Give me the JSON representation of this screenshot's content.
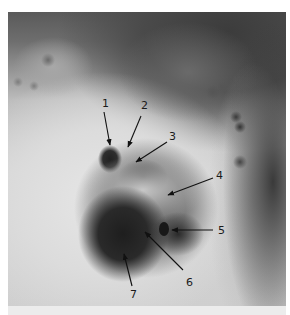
{
  "figure": {
    "type": "photograph",
    "colors": {
      "background": "#ffffff",
      "arrow": "#111111",
      "label": "#1a1a1a",
      "bottom_strip": "#ececec"
    },
    "annotations": [
      {
        "label": "1",
        "text_x": 102,
        "text_y": 107,
        "arrow": [
          104,
          112,
          110,
          145
        ]
      },
      {
        "label": "2",
        "text_x": 141,
        "text_y": 109,
        "arrow": [
          141,
          116,
          128,
          147
        ]
      },
      {
        "label": "3",
        "text_x": 169,
        "text_y": 140,
        "arrow": [
          167,
          142,
          136,
          162
        ]
      },
      {
        "label": "4",
        "text_x": 216,
        "text_y": 179,
        "arrow": [
          213,
          178,
          168,
          195
        ]
      },
      {
        "label": "5",
        "text_x": 218,
        "text_y": 234,
        "arrow": [
          213,
          230,
          172,
          230
        ]
      },
      {
        "label": "6",
        "text_x": 186,
        "text_y": 286,
        "arrow": [
          183,
          270,
          145,
          232
        ]
      },
      {
        "label": "7",
        "text_x": 130,
        "text_y": 298,
        "arrow": [
          132,
          286,
          124,
          254
        ]
      }
    ]
  }
}
